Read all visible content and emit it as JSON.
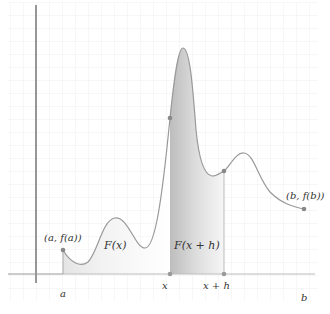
{
  "figure": {
    "colors": {
      "background": "#ffffff",
      "grid": "#eeeeee",
      "axis": "#555555",
      "baseline": "#bbbbbb",
      "curve": "#999999",
      "point": "#888888",
      "fill_light": "#f2f2f2",
      "fill_dark": "#c4c4c4"
    },
    "points": {
      "start": {
        "label": "(a, f(a))"
      },
      "end": {
        "label": "(b, f(b))"
      }
    },
    "regions": {
      "left": {
        "label": "F(x)"
      },
      "right": {
        "label": "F(x + h)"
      }
    },
    "ticks": {
      "a": "a",
      "x": "x",
      "xh": "x + h",
      "b": "b"
    }
  }
}
